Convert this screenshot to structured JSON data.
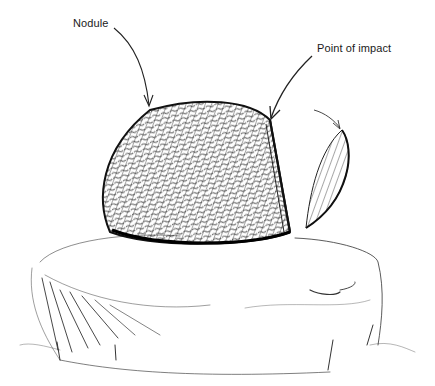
{
  "diagram": {
    "style": "pencil-sketch",
    "background": "#ffffff",
    "ink_color": "#1a1a1a",
    "labels": [
      {
        "id": "nodule",
        "text": "Nodule"
      },
      {
        "id": "point_of_impact",
        "text": "Point of impact"
      }
    ],
    "parts": [
      {
        "name": "nodule",
        "description": "textured stone nodule resting on anvil"
      },
      {
        "name": "flake",
        "description": "detached flake flying off to the right"
      },
      {
        "name": "anvil-stone",
        "description": "large flat stone beneath the nodule"
      }
    ]
  }
}
